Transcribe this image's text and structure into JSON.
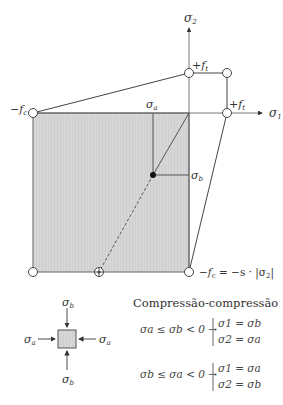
{
  "diagram": {
    "axes": {
      "x_label": "σ",
      "x_sub": "1",
      "y_label": "σ",
      "y_sub": "2"
    },
    "labels": {
      "fc_left": "−f",
      "fc_left_sub": "c",
      "ft_top": "+f",
      "ft_top_sub": "t",
      "ft_right": "+f",
      "ft_right_sub": "t",
      "sigma_a": "σ",
      "sigma_a_sub": "a",
      "sigma_b": "σ",
      "sigma_b_sub": "b",
      "fc_bottom": "−f",
      "fc_bottom_sub": "c",
      "fc_bottom_eq": " = −s · |σ",
      "fc_bottom_eq_sub": "2",
      "fc_bottom_eq_end": "|"
    },
    "element": {
      "top": "σ",
      "top_sub": "b",
      "bottom": "σ",
      "bottom_sub": "b",
      "left": "σ",
      "left_sub": "a",
      "right": "σ",
      "right_sub": "a"
    },
    "legend": {
      "title": "Compressão-compressão",
      "case1": {
        "condition": "σa ≤ σb < 0 →",
        "line1": "σ1 = σb",
        "line2": "σ2 = σa"
      },
      "case2": {
        "condition": "σb ≤ σa < 0 →",
        "line1": "σ1 = σa",
        "line2": "σ2 = σb"
      }
    },
    "colors": {
      "fill": "#d4d4d4",
      "line": "#555555",
      "text": "#333333"
    }
  }
}
